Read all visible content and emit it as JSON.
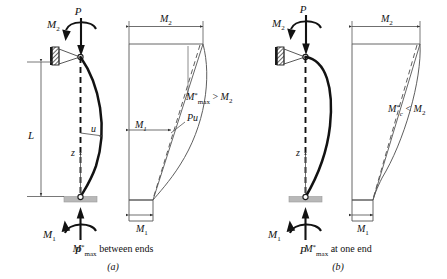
{
  "figure": {
    "background_color": "#ffffff",
    "line_color": "#1a1a1a",
    "thin_line_color": "#555555",
    "support_pad_color": "#b8b8b8"
  },
  "panel_a": {
    "id": "a",
    "letter": "(a)",
    "caption_main": "M",
    "caption_star": "*",
    "caption_sub": "max",
    "caption_rest": " between ends",
    "caption_full": "M*max between ends",
    "loads": {
      "axial_top_label": "P",
      "axial_bottom_label": "P",
      "moment_top_label": "M",
      "moment_top_sub": "2",
      "moment_bottom_label": "M",
      "moment_bottom_sub": "1"
    },
    "geometry": {
      "length_label": "L",
      "deflection_label": "u",
      "coordinate_label": "z"
    },
    "moment_diagram": {
      "top_dim_label": "M",
      "top_dim_sub": "2",
      "mid_dim_label": "M",
      "mid_dim_sub": "1",
      "bottom_dim_label": "M",
      "bottom_dim_sub": "1",
      "secondary_label": "Pu",
      "annotation_base": "M",
      "annotation_star": "*",
      "annotation_sub": "max",
      "annotation_rel": " > ",
      "annotation_rhs": "M",
      "annotation_rhs_sub": "2",
      "annotation_full": "M*max > M2"
    }
  },
  "panel_b": {
    "id": "b",
    "letter": "(b)",
    "caption_main": "M",
    "caption_star": "*",
    "caption_sub": "max",
    "caption_rest": " at one end",
    "caption_full": "M*max at one end",
    "loads": {
      "axial_top_label": "P",
      "axial_bottom_label": "P",
      "moment_top_label": "M",
      "moment_top_sub": "2",
      "moment_bottom_label": "M",
      "moment_bottom_sub": "1"
    },
    "geometry": {
      "coordinate_label": "z"
    },
    "moment_diagram": {
      "top_dim_label": "M",
      "top_dim_sub": "2",
      "bottom_dim_label": "M",
      "bottom_dim_sub": "1",
      "annotation_base": "M",
      "annotation_star": "*",
      "annotation_sub": "c",
      "annotation_rel": " < ",
      "annotation_rhs": "M",
      "annotation_rhs_sub": "2",
      "annotation_full": "M*c < M2"
    }
  }
}
